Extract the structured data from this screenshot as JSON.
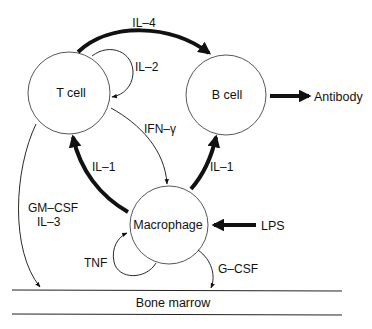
{
  "diagram": {
    "type": "cytokine-network",
    "nodes": {
      "t_cell": {
        "label": "T cell",
        "cx": 69,
        "cy": 93,
        "r": 41
      },
      "b_cell": {
        "label": "B cell",
        "cx": 226,
        "cy": 95,
        "r": 40
      },
      "macrophage": {
        "label": "Macrophage",
        "cx": 169,
        "cy": 225,
        "r": 39
      }
    },
    "external": {
      "antibody": "Antibody",
      "lps": "LPS",
      "bone_marrow": "Bone marrow"
    },
    "edges": [
      {
        "id": "il4",
        "from": "T cell",
        "to": "B cell",
        "label": "IL–4",
        "weight": "thick"
      },
      {
        "id": "il2",
        "from": "T cell",
        "to": "T cell",
        "label": "IL–2",
        "weight": "thin"
      },
      {
        "id": "ifng",
        "from": "T cell",
        "to": "Macrophage",
        "label": "IFN–γ",
        "weight": "thin"
      },
      {
        "id": "il1_t",
        "from": "Macrophage",
        "to": "T cell",
        "label": "IL–1",
        "weight": "thick"
      },
      {
        "id": "il1_b",
        "from": "Macrophage",
        "to": "B cell",
        "label": "IL–1",
        "weight": "thick"
      },
      {
        "id": "antibody",
        "from": "B cell",
        "to": "Antibody",
        "label": "",
        "weight": "thick"
      },
      {
        "id": "lps",
        "from": "LPS",
        "to": "Macrophage",
        "label": "",
        "weight": "thick"
      },
      {
        "id": "tnf",
        "from": "Macrophage",
        "to": "Macrophage",
        "label": "TNF",
        "weight": "thin"
      },
      {
        "id": "gmcsf",
        "from": "T cell",
        "to": "Bone marrow",
        "label": "GM–CSF",
        "label2": "IL–3",
        "weight": "thin"
      },
      {
        "id": "gcsf",
        "from": "Macrophage",
        "to": "Bone marrow",
        "label": "G–CSF",
        "weight": "thin"
      }
    ],
    "labels": {
      "il4": "IL–4",
      "il2": "IL–2",
      "ifng": "IFN–γ",
      "il1_left": "IL–1",
      "il1_right": "IL–1",
      "tnf": "TNF",
      "gmcsf": "GM–CSF",
      "il3": "IL–3",
      "gcsf": "G–CSF"
    },
    "colors": {
      "stroke": "#111111",
      "background": "#ffffff"
    }
  }
}
